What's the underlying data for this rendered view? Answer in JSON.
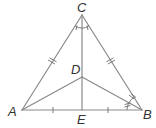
{
  "diagram": {
    "type": "geometry-figure",
    "stroke_color": "#8a8a8a",
    "label_color": "#333333",
    "points": {
      "A": {
        "label": "A",
        "x": 22,
        "y": 110
      },
      "B": {
        "label": "B",
        "x": 142,
        "y": 110
      },
      "C": {
        "label": "C",
        "x": 82,
        "y": 15
      },
      "D": {
        "label": "D",
        "x": 82,
        "y": 77
      },
      "E": {
        "label": "E",
        "x": 82,
        "y": 110
      }
    },
    "segments": [
      "AC",
      "BC",
      "AB",
      "CE",
      "AD",
      "BD"
    ],
    "markings": {
      "congruent_sides_AC_BC": "double-tick",
      "congruent_segments_AE_EB": "single-tick",
      "angle_ACE_ECB": "equal-angle single-tick arcs",
      "angle_ABD_DBC": "equal-angle double-tick arcs"
    }
  }
}
